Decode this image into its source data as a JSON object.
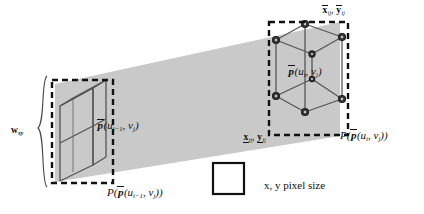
{
  "figure": {
    "colors": {
      "band_fill": "#c9c9c9",
      "stroke": "#4a4a4a",
      "dashed": "#111111",
      "node_fill": "#2a2a2a",
      "text": "#111111",
      "legend_square_border": "#111111"
    }
  },
  "labels": {
    "w_xy": {
      "base": "w",
      "sub": "xy"
    },
    "p_left": {
      "p": "p",
      "args_open": "(",
      "u": "u",
      "u_sub": "i−1",
      "comma": ", ",
      "v": "v",
      "v_sub": "j",
      "args_close": ")"
    },
    "P_left": {
      "P": "P",
      "open": "(",
      "p": "p",
      "inner_open": "(",
      "u": "u",
      "u_sub": "i−1",
      "comma": ", ",
      "v": "v",
      "v_sub": "j",
      "inner_close": ")",
      "close": ")"
    },
    "p_right": {
      "p": "p",
      "args_open": "(",
      "u": "u",
      "u_sub": "i",
      "comma": ", ",
      "v": "v",
      "v_sub": "j",
      "args_close": ")"
    },
    "P_right": {
      "P": "P",
      "open": "(",
      "p": "p",
      "inner_open": "(",
      "u": "u",
      "u_sub": "i",
      "comma": ", ",
      "v": "v",
      "v_sub": "j",
      "inner_close": ")",
      "close": ")"
    },
    "upper_bounds": {
      "x": "x",
      "x_sub": "ij",
      "sep": ", ",
      "y": "y",
      "y_sub": "ij"
    },
    "lower_bounds": {
      "x": "x",
      "x_sub": "ij",
      "sep": ", ",
      "y": "y",
      "y_sub": "ij"
    },
    "legend": {
      "text": "x, y pixel size"
    }
  },
  "geometry": {
    "band": {
      "type": "quad",
      "points": "55,84 340,22 340,136 55,182"
    },
    "left_dashed_box": {
      "x": 52,
      "y": 80,
      "w": 61,
      "h": 103
    },
    "right_dashed_box": {
      "x": 269,
      "y": 22,
      "w": 79,
      "h": 113
    },
    "legend_square": {
      "x": 213,
      "y": 163,
      "w": 31,
      "h": 31
    }
  }
}
